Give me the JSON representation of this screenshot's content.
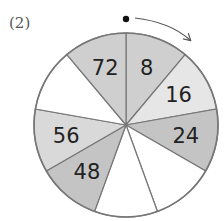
{
  "problem": {
    "label": "(2)"
  },
  "wheel": {
    "center": [
      126,
      125
    ],
    "radius": 92,
    "segment_count": 9,
    "start_marker": "dot-at-top",
    "direction": "clockwise",
    "segments": [
      {
        "value": "8",
        "fill": "#cfcfcf"
      },
      {
        "value": "16",
        "fill": "#e6e6e6"
      },
      {
        "value": "24",
        "fill": "#c4c4c4"
      },
      {
        "value": "",
        "fill": "#ffffff"
      },
      {
        "value": "",
        "fill": "#ffffff"
      },
      {
        "value": "48",
        "fill": "#c4c4c4"
      },
      {
        "value": "56",
        "fill": "#d9d9d9"
      },
      {
        "value": "",
        "fill": "#ffffff"
      },
      {
        "value": "72",
        "fill": "#cfcfcf"
      }
    ],
    "colors": {
      "stroke": "#777777",
      "text": "#222222",
      "marker": "#111111"
    }
  }
}
